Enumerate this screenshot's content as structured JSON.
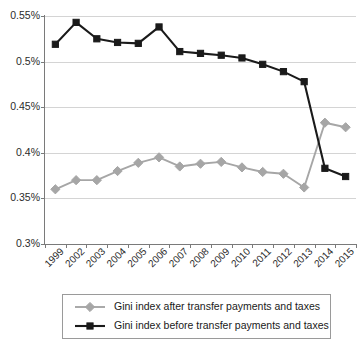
{
  "chart_data": {
    "type": "line",
    "title": "",
    "xlabel": "",
    "ylabel": "",
    "categories": [
      "1999",
      "2002",
      "2003",
      "2004",
      "2005",
      "2006",
      "2007",
      "2008",
      "2009",
      "2010",
      "2011",
      "2012",
      "2013",
      "2014",
      "2015"
    ],
    "ylim": [
      0.3,
      0.55
    ],
    "ytick_labels": [
      "0.55%",
      "0.5%",
      "0.45%",
      "0.4%",
      "0.35%",
      "0.3%"
    ],
    "ytick_values": [
      0.55,
      0.5,
      0.45,
      0.4,
      0.35,
      0.3
    ],
    "grid": true,
    "legend_position": "bottom",
    "series": [
      {
        "name": "Gini index after transfer payments and taxes",
        "color": "#a6a6a6",
        "marker": "diamond",
        "values": [
          0.36,
          0.37,
          0.37,
          0.38,
          0.389,
          0.395,
          0.385,
          0.388,
          0.39,
          0.384,
          0.379,
          0.377,
          0.362,
          0.433,
          0.428
        ]
      },
      {
        "name": "Gini index before transfer payments and taxes",
        "color": "#1a1a1a",
        "marker": "square",
        "values": [
          0.519,
          0.543,
          0.525,
          0.521,
          0.52,
          0.538,
          0.511,
          0.509,
          0.507,
          0.504,
          0.497,
          0.489,
          0.478,
          0.383,
          0.374
        ]
      }
    ]
  },
  "legend": {
    "items": [
      {
        "label": "Gini index after transfer payments and taxes"
      },
      {
        "label": "Gini index before transfer payments and taxes"
      }
    ]
  }
}
